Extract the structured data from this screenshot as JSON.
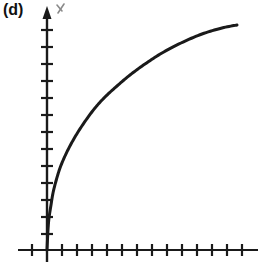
{
  "figure": {
    "panel_label": "(d)",
    "background_color": "#ffffff",
    "ink_color": "#1a1a1a",
    "width": 261,
    "height": 274
  },
  "axes": {
    "origin_px": [
      47,
      250
    ],
    "y_axis": {
      "name": "y-axis",
      "arrow": true,
      "arrow_label": "y",
      "top_px": 8,
      "bottom_px": 262,
      "tick_count": 13,
      "tick_spacing_px": 16,
      "tick_half_length_px": 6
    },
    "x_axis": {
      "name": "x-axis",
      "arrow": false,
      "left_px": 18,
      "right_px": 258,
      "tick_count": 14,
      "tick_spacing_px": 15,
      "tick_half_length_px": 6
    }
  },
  "chart_data": {
    "type": "line",
    "title": "(d)",
    "xlabel": "",
    "ylabel": "y",
    "grid": false,
    "legend": null,
    "xlim": [
      0,
      14
    ],
    "ylim": [
      0,
      15
    ],
    "curve_name": "square-root-curve",
    "x": [
      0,
      0.1,
      0.25,
      0.5,
      0.8,
      1.2,
      1.7,
      2.3,
      3.0,
      3.8,
      4.7,
      5.7,
      6.8,
      8.0,
      9.3,
      10.7,
      12.2,
      12.7
    ],
    "y": [
      0,
      1.25,
      1.95,
      2.7,
      3.4,
      4.1,
      4.85,
      5.6,
      6.35,
      7.1,
      7.85,
      8.6,
      9.35,
      10.05,
      10.75,
      11.5,
      12.2,
      14.1
    ],
    "points_px": [
      [
        47,
        250
      ],
      [
        48,
        230
      ],
      [
        49,
        218
      ],
      [
        51,
        205
      ],
      [
        53,
        193
      ],
      [
        56,
        181
      ],
      [
        60,
        168
      ],
      [
        65,
        156
      ],
      [
        71,
        144
      ],
      [
        78,
        132
      ],
      [
        86,
        120
      ],
      [
        95,
        108
      ],
      [
        105,
        97
      ],
      [
        117,
        86
      ],
      [
        130,
        75
      ],
      [
        145,
        64
      ],
      [
        162,
        53
      ],
      [
        181,
        43
      ],
      [
        202,
        34
      ],
      [
        222,
        28
      ],
      [
        237,
        25
      ]
    ],
    "stroke_width_px": 3
  }
}
